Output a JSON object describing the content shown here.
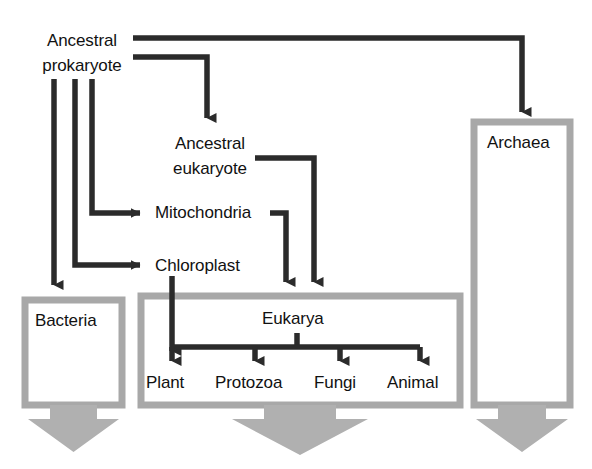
{
  "diagram": {
    "type": "flow-diagram",
    "background_color": "#ffffff",
    "arrow_color": "#2b2b2b",
    "domain_box_color": "#a8a8a8",
    "domain_box_fill": "#ffffff",
    "text_color": "#111111"
  },
  "nodes": {
    "ancestral_prokaryote": {
      "label": "Ancestral\nprokaryote",
      "line1": "Ancestral",
      "line2": "prokaryote"
    },
    "ancestral_eukaryote": {
      "label": "Ancestral\neukaryote",
      "line1": "Ancestral",
      "line2": "eukaryote"
    },
    "mitochondria": {
      "label": "Mitochondria"
    },
    "chloroplast": {
      "label": "Chloroplast"
    },
    "eukarya": {
      "label": "Eukarya"
    }
  },
  "domain_boxes": [
    {
      "id": "bacteria",
      "label": "Bacteria"
    },
    {
      "id": "eukarya",
      "label": "Eukarya"
    },
    {
      "id": "archaea",
      "label": "Archaea"
    }
  ],
  "kingdoms": [
    {
      "label": "Plant"
    },
    {
      "label": "Protozoa"
    },
    {
      "label": "Fungi"
    },
    {
      "label": "Animal"
    }
  ],
  "edges": [
    {
      "from": "ancestral_prokaryote",
      "to": "archaea"
    },
    {
      "from": "ancestral_prokaryote",
      "to": "ancestral_eukaryote"
    },
    {
      "from": "ancestral_prokaryote",
      "to": "mitochondria"
    },
    {
      "from": "ancestral_prokaryote",
      "to": "chloroplast"
    },
    {
      "from": "ancestral_prokaryote",
      "to": "bacteria"
    },
    {
      "from": "ancestral_eukaryote",
      "to": "eukarya"
    },
    {
      "from": "mitochondria",
      "to": "eukarya"
    },
    {
      "from": "chloroplast",
      "to": "plant"
    },
    {
      "from": "eukarya",
      "to": "plant"
    },
    {
      "from": "eukarya",
      "to": "protozoa"
    },
    {
      "from": "eukarya",
      "to": "fungi"
    },
    {
      "from": "eukarya",
      "to": "animal"
    }
  ],
  "caption": {
    "text": ""
  }
}
